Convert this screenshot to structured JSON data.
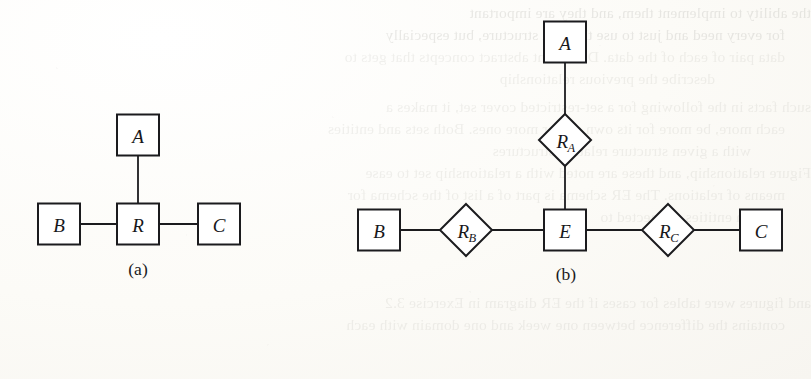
{
  "figure": {
    "caption_a": "(a)",
    "caption_b": "(b)",
    "diagrams": [
      {
        "id": "a",
        "caption": "(a)",
        "kind": "n-ary-relationship",
        "nodes": [
          {
            "name": "node-a",
            "label": "A",
            "shape": "rectangle",
            "cx": 138,
            "cy": 135,
            "w": 42,
            "h": 41
          },
          {
            "name": "node-b",
            "label": "B",
            "shape": "rectangle",
            "cx": 59,
            "cy": 224,
            "w": 42,
            "h": 41
          },
          {
            "name": "node-r",
            "label": "R",
            "shape": "rectangle",
            "cx": 138,
            "cy": 224,
            "w": 42,
            "h": 41
          },
          {
            "name": "node-c",
            "label": "C",
            "shape": "rectangle",
            "cx": 219,
            "cy": 224,
            "w": 42,
            "h": 41
          }
        ],
        "edges": [
          {
            "name": "edge-a-r",
            "from": "A",
            "to": "R",
            "x1": 138,
            "y1": 156,
            "x2": 138,
            "y2": 204
          },
          {
            "name": "edge-b-r",
            "from": "B",
            "to": "R",
            "x1": 80,
            "y1": 224,
            "x2": 117,
            "y2": 224
          },
          {
            "name": "edge-r-c",
            "from": "R",
            "to": "C",
            "x1": 159,
            "y1": 224,
            "x2": 198,
            "y2": 224
          }
        ]
      },
      {
        "id": "b",
        "caption": "(b)",
        "kind": "binary-relationships-via-entity",
        "nodes": [
          {
            "name": "node-a",
            "label": "A",
            "shape": "rectangle",
            "cx": 565,
            "cy": 42,
            "w": 42,
            "h": 41
          },
          {
            "name": "node-ra",
            "label": "R",
            "sub": "A",
            "shape": "diamond",
            "cx": 565,
            "cy": 140,
            "w": 52,
            "h": 52
          },
          {
            "name": "node-e",
            "label": "E",
            "shape": "rectangle",
            "cx": 565,
            "cy": 230,
            "w": 42,
            "h": 41
          },
          {
            "name": "node-b",
            "label": "B",
            "shape": "rectangle",
            "cx": 379,
            "cy": 230,
            "w": 42,
            "h": 41
          },
          {
            "name": "node-rb",
            "label": "R",
            "sub": "B",
            "shape": "diamond",
            "cx": 466,
            "cy": 230,
            "w": 52,
            "h": 52
          },
          {
            "name": "node-rc",
            "label": "R",
            "sub": "C",
            "shape": "diamond",
            "cx": 668,
            "cy": 230,
            "w": 52,
            "h": 52
          },
          {
            "name": "node-c",
            "label": "C",
            "shape": "rectangle",
            "cx": 761,
            "cy": 230,
            "w": 42,
            "h": 41
          }
        ],
        "edges": [
          {
            "name": "edge-a-ra",
            "from": "A",
            "to": "R_A",
            "x1": 565,
            "y1": 63,
            "x2": 565,
            "y2": 114
          },
          {
            "name": "edge-ra-e",
            "from": "R_A",
            "to": "E",
            "x1": 565,
            "y1": 166,
            "x2": 565,
            "y2": 210
          },
          {
            "name": "edge-b-rb",
            "from": "B",
            "to": "R_B",
            "x1": 400,
            "y1": 230,
            "x2": 440,
            "y2": 230
          },
          {
            "name": "edge-rb-e",
            "from": "R_B",
            "to": "E",
            "x1": 492,
            "y1": 230,
            "x2": 544,
            "y2": 230
          },
          {
            "name": "edge-e-rc",
            "from": "E",
            "to": "R_C",
            "x1": 586,
            "y1": 230,
            "x2": 642,
            "y2": 230
          },
          {
            "name": "edge-rc-c",
            "from": "R_C",
            "to": "C",
            "x1": 694,
            "y1": 230,
            "x2": 740,
            "y2": 230
          }
        ]
      }
    ],
    "colors": {
      "stroke": "#1b1b1e",
      "fill": "#ffffff",
      "page": "#fdfdfb",
      "text": "#17171a"
    }
  },
  "background_show_through": {
    "note": "Mirror-reversed ink bleeding through from the reverse side of the scanned page; mostly illegible.",
    "top_lines": [
      "the ability to implement them, and they are important",
      "for every need and just to use the data structure, but especially",
      "data pair of each of the data. Document abstract concepts that gets to",
      "describe the previous relationship"
    ],
    "middle_lines": [
      "such facts in the following for a set-restricted cover set, it makes a",
      "each more, be more for its own set, or more ones. Both sets and entities",
      "with a given structure relation structures",
      "Figure relationship, and these are noted with a relationship set to ease",
      "means of relations. The ER schema is part of a list of the schema for",
      "an entities connected to"
    ],
    "bottom_lines": [
      "and figures were tables for cases if the ER diagram in Exercise 3.2",
      "contains the difference between one week and one domain with each"
    ]
  }
}
